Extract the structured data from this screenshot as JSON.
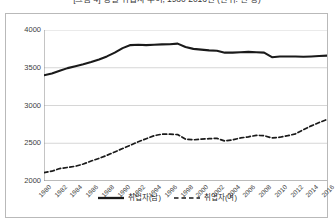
{
  "title": "[그림 4] 성별 취업자 추이, 1980-2016년 (단위: 천 명)",
  "chart_data": {
    "type": "line",
    "title": "[그림 4] 성별 취업자 추이, 1980-2016년 (단위: 천 명)",
    "xlabel": "",
    "ylabel": "",
    "ylim": [
      2000,
      4000
    ],
    "yticks": [
      2000,
      2500,
      3000,
      3500,
      4000
    ],
    "grid": true,
    "legend_position": "bottom",
    "x": [
      1980,
      1981,
      1982,
      1983,
      1984,
      1985,
      1986,
      1987,
      1988,
      1989,
      1990,
      1991,
      1992,
      1993,
      1994,
      1995,
      1996,
      1997,
      1998,
      1999,
      2000,
      2001,
      2002,
      2003,
      2004,
      2005,
      2006,
      2007,
      2008,
      2009,
      2010,
      2011,
      2012,
      2013,
      2014,
      2015,
      2016
    ],
    "xticks": [
      1980,
      1982,
      1984,
      1986,
      1988,
      1990,
      1992,
      1994,
      1996,
      1998,
      2000,
      2002,
      2004,
      2006,
      2008,
      2010,
      2012,
      2014,
      2016
    ],
    "series": [
      {
        "name": "취업자(남)",
        "style": "solid",
        "color": "#1a1a1a",
        "values": [
          3400,
          3425,
          3460,
          3495,
          3520,
          3545,
          3575,
          3610,
          3650,
          3700,
          3760,
          3800,
          3805,
          3800,
          3805,
          3810,
          3812,
          3820,
          3775,
          3750,
          3740,
          3730,
          3725,
          3700,
          3700,
          3705,
          3710,
          3705,
          3700,
          3640,
          3650,
          3650,
          3650,
          3645,
          3650,
          3655,
          3660
        ]
      },
      {
        "name": "취업자(여)",
        "style": "dashed",
        "color": "#1a1a1a",
        "values": [
          2110,
          2130,
          2165,
          2180,
          2195,
          2225,
          2265,
          2300,
          2340,
          2385,
          2430,
          2475,
          2520,
          2560,
          2600,
          2620,
          2620,
          2615,
          2555,
          2545,
          2555,
          2560,
          2565,
          2530,
          2545,
          2570,
          2585,
          2605,
          2600,
          2570,
          2580,
          2600,
          2625,
          2680,
          2730,
          2775,
          2815
        ]
      }
    ]
  }
}
